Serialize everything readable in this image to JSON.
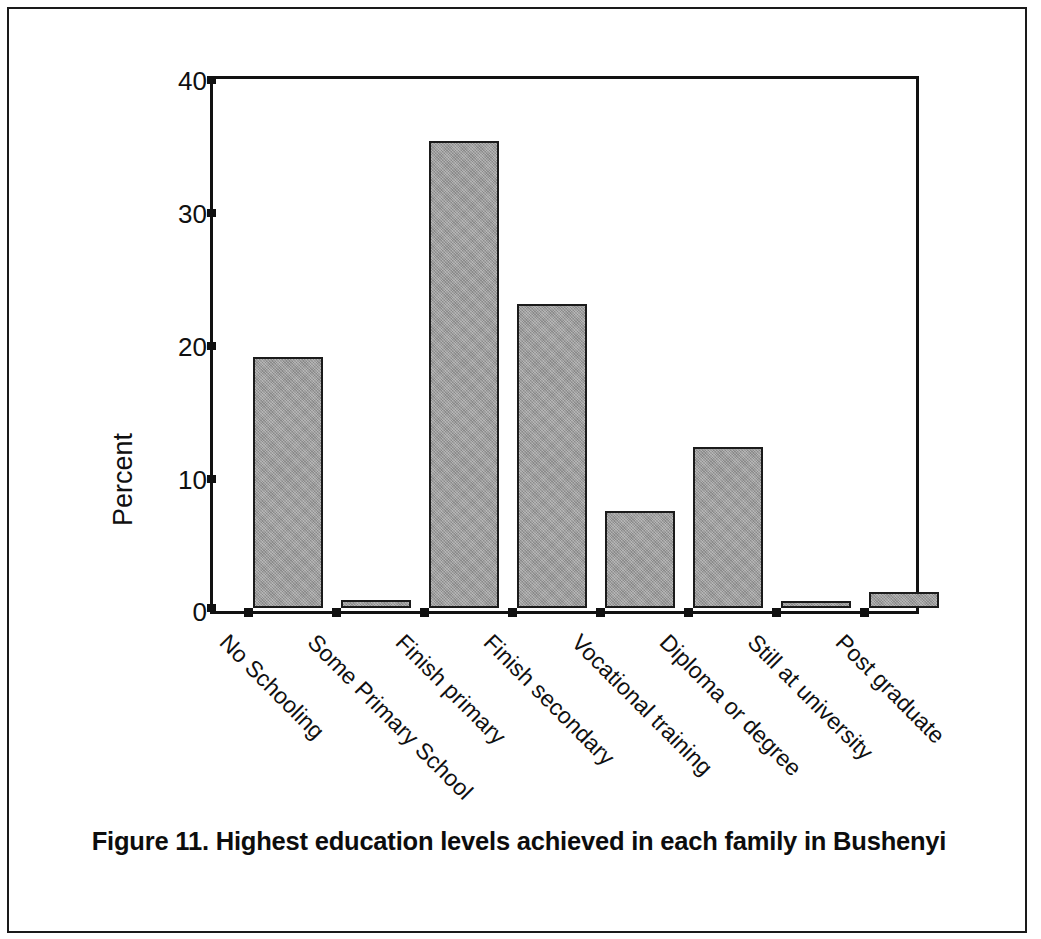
{
  "caption": "Figure 11. Highest education levels achieved in each family in Bushenyi",
  "axis": {
    "ylabel": "Percent",
    "yticks": [
      "0",
      "10",
      "20",
      "30",
      "40"
    ]
  },
  "colors": {
    "bar_fill": "#9d9d9d",
    "bar_stroke": "#1b1b1b",
    "axis": "#101010",
    "frame": "#1a1a1a",
    "text": "#101010"
  },
  "chart_data": {
    "type": "bar",
    "title": "Figure 11. Highest education levels achieved in each family in Bushenyi",
    "xlabel": "",
    "ylabel": "Percent",
    "ylim": [
      0,
      40
    ],
    "yticks": [
      0,
      10,
      20,
      30,
      40
    ],
    "grid": false,
    "legend": "none",
    "categories": [
      "No Schooling",
      "Some Primary School",
      "Finish primary",
      "Finish secondary",
      "Vocational training",
      "Diploma or degree",
      "Still at university",
      "Post graduate"
    ],
    "values": [
      19.0,
      0.6,
      35.3,
      23.0,
      7.3,
      12.2,
      0.5,
      1.2
    ]
  }
}
